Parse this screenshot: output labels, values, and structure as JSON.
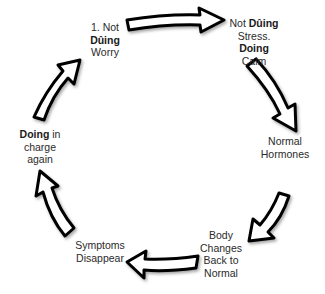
{
  "diagram": {
    "type": "cycle",
    "direction": "clockwise",
    "arrow_style": {
      "fill": "#ffffff",
      "stroke": "#000000"
    },
    "nodes": [
      {
        "id": "n1",
        "lines": [
          {
            "parts": [
              {
                "text": "1. Not",
                "bold": false
              }
            ]
          },
          {
            "parts": [
              {
                "text": "Dûing",
                "bold": true
              }
            ]
          },
          {
            "parts": [
              {
                "text": "Worry",
                "bold": false
              }
            ]
          }
        ]
      },
      {
        "id": "n2",
        "lines": [
          {
            "parts": [
              {
                "text": "Not ",
                "bold": false
              },
              {
                "text": "Dûing",
                "bold": true
              }
            ]
          },
          {
            "parts": [
              {
                "text": "Stress.",
                "bold": false
              }
            ]
          },
          {
            "parts": [
              {
                "text": "Doing",
                "bold": true
              }
            ]
          },
          {
            "parts": [
              {
                "text": "Calm",
                "bold": false
              }
            ]
          }
        ]
      },
      {
        "id": "n3",
        "lines": [
          {
            "parts": [
              {
                "text": "Normal",
                "bold": false
              }
            ]
          },
          {
            "parts": [
              {
                "text": "Hormones",
                "bold": false
              }
            ]
          }
        ]
      },
      {
        "id": "n4",
        "lines": [
          {
            "parts": [
              {
                "text": "Body",
                "bold": false
              }
            ]
          },
          {
            "parts": [
              {
                "text": "Changes",
                "bold": false
              }
            ]
          },
          {
            "parts": [
              {
                "text": "Back to",
                "bold": false
              }
            ]
          },
          {
            "parts": [
              {
                "text": "Normal",
                "bold": false
              }
            ]
          }
        ]
      },
      {
        "id": "n5",
        "lines": [
          {
            "parts": [
              {
                "text": "Symptoms",
                "bold": false
              }
            ]
          },
          {
            "parts": [
              {
                "text": "Disappear",
                "bold": false
              }
            ]
          }
        ]
      },
      {
        "id": "n6",
        "lines": [
          {
            "parts": [
              {
                "text": "Doing",
                "bold": true
              },
              {
                "text": " in",
                "bold": false
              }
            ]
          },
          {
            "parts": [
              {
                "text": "charge",
                "bold": false
              }
            ]
          },
          {
            "parts": [
              {
                "text": "again",
                "bold": false
              }
            ]
          }
        ]
      }
    ],
    "edges": [
      {
        "from": "n1",
        "to": "n2"
      },
      {
        "from": "n2",
        "to": "n3"
      },
      {
        "from": "n3",
        "to": "n4"
      },
      {
        "from": "n4",
        "to": "n5"
      },
      {
        "from": "n5",
        "to": "n6"
      },
      {
        "from": "n6",
        "to": "n1"
      }
    ]
  }
}
